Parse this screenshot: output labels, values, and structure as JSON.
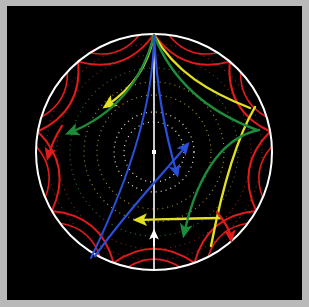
{
  "figure": {
    "width": 309,
    "height": 307,
    "background_color": "#000000",
    "frame_color": "#b9b9b9",
    "plate": {
      "x": 7,
      "y": 6,
      "width": 295,
      "height": 294
    }
  },
  "colors": {
    "boundary": "#ffffff",
    "axis": "#ffffff",
    "red": "#e01b1b",
    "green": "#1e8a3c",
    "yellow": "#e3e021",
    "blue": "#2a4fd8",
    "dotted_white": "#e8e8dd",
    "dotted_yellow": "#9a8c2a",
    "dotted_green": "#2f6b3a",
    "dotted_red": "#7a2222",
    "center_dot": "#ffffff"
  },
  "disk": {
    "center_x": 154,
    "center_y": 152,
    "radius": 118,
    "boundary_stroke_width": 2.0,
    "label": "unit-disk-boundary"
  },
  "vertical_axis": {
    "x": 154,
    "y_top": 34,
    "y_bottom": 270,
    "stroke_width": 1.6,
    "label": "vertical-geodesic-axis"
  },
  "center_marker": {
    "x": 154,
    "y": 152,
    "size": 4,
    "shape": "square",
    "label": "origin-marker"
  },
  "dotted_circles": [
    {
      "radius": 30,
      "color": "#e8e8dd",
      "dash": "1 4"
    },
    {
      "radius": 40,
      "color": "#e8e8dd",
      "dash": "1 4"
    },
    {
      "radius": 57,
      "color": "#9a8c2a",
      "dash": "1 4"
    },
    {
      "radius": 70,
      "color": "#9a8c2a",
      "dash": "1 4"
    },
    {
      "radius": 84,
      "color": "#2f6b3a",
      "dash": "1 4"
    },
    {
      "radius": 97,
      "color": "#7a2222",
      "dash": "1 4"
    },
    {
      "radius": 108,
      "color": "#7a2222",
      "dash": "1 4"
    }
  ],
  "boundary_scallops": {
    "color": "#e01b1b",
    "count": 9,
    "stroke_width": 2.0,
    "description": "nested red horocyclic arcs tangent to the boundary circle"
  },
  "curves": [
    {
      "name": "geodesic-blue-inner",
      "color": "#2a4fd8",
      "arrow": true,
      "label": "blue-geodesic-1"
    },
    {
      "name": "geodesic-blue-outer",
      "color": "#2a4fd8",
      "arrow": true,
      "label": "blue-geodesic-2"
    },
    {
      "name": "geodesic-green-left",
      "color": "#1e8a3c",
      "arrow": true,
      "label": "green-geodesic-left"
    },
    {
      "name": "geodesic-green-right",
      "color": "#1e8a3c",
      "arrow": true,
      "label": "green-geodesic-right"
    },
    {
      "name": "geodesic-green-down",
      "color": "#1e8a3c",
      "arrow": true,
      "label": "green-geodesic-down"
    },
    {
      "name": "geodesic-yellow-left",
      "color": "#e3e021",
      "arrow": true,
      "label": "yellow-geodesic-left"
    },
    {
      "name": "geodesic-yellow-right",
      "color": "#e3e021",
      "arrow": true,
      "label": "yellow-geodesic-right"
    },
    {
      "name": "geodesic-yellow-down",
      "color": "#e3e021",
      "arrow": true,
      "label": "yellow-geodesic-down"
    }
  ],
  "arrows": [
    {
      "id": "blue-up-right",
      "color": "#2a4fd8",
      "tip_x": 186,
      "tip_y": 141,
      "angle_deg": -32,
      "label": "blue-arrow-up-right"
    },
    {
      "id": "blue-down-right",
      "color": "#2a4fd8",
      "tip_x": 176,
      "tip_y": 176,
      "angle_deg": 58,
      "label": "blue-arrow-down-right"
    },
    {
      "id": "yellow-left-up",
      "color": "#e3e021",
      "tip_x": 88,
      "tip_y": 110,
      "angle_deg": 190,
      "label": "yellow-arrow-left-upper"
    },
    {
      "id": "green-left",
      "color": "#1e8a3c",
      "tip_x": 64,
      "tip_y": 133,
      "angle_deg": 200,
      "label": "green-arrow-left"
    },
    {
      "id": "yellow-left-down",
      "color": "#e3e021",
      "tip_x": 133,
      "tip_y": 220,
      "angle_deg": 183,
      "label": "yellow-arrow-left-lower"
    },
    {
      "id": "green-down",
      "color": "#1e8a3c",
      "tip_x": 181,
      "tip_y": 240,
      "angle_deg": 80,
      "label": "green-arrow-down"
    },
    {
      "id": "red-left",
      "color": "#e01b1b",
      "tip_x": 47,
      "tip_y": 154,
      "angle_deg": 100,
      "label": "red-arrow-left"
    },
    {
      "id": "red-right",
      "color": "#e01b1b",
      "tip_x": 228,
      "tip_y": 238,
      "angle_deg": 115,
      "label": "red-arrow-bottom-right"
    },
    {
      "id": "white-up",
      "color": "#ffffff",
      "tip_x": 154,
      "tip_y": 232,
      "angle_deg": -90,
      "label": "white-arrow-up"
    }
  ],
  "annotations": {
    "none_visible": "no text labels appear in the figure"
  }
}
